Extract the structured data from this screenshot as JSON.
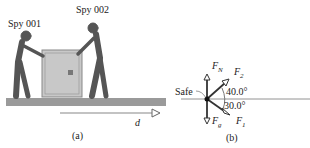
{
  "panel_a": {
    "spy1_label": "Spy 001",
    "spy2_label": "Spy 002",
    "displacement_label": "d",
    "caption": "(a)"
  },
  "panel_b": {
    "safe_label": "Safe",
    "forces": {
      "normal": "F",
      "normal_sub": "N",
      "gravity": "F",
      "gravity_sub": "g",
      "f1": "F",
      "f1_sub": "1",
      "f2": "F",
      "f2_sub": "2"
    },
    "angle_upper": "40.0°",
    "angle_lower": "30.0°",
    "caption": "(b)"
  },
  "colors": {
    "floor": "#9a9a9a",
    "safe": "#c8c8c8",
    "figure": "#555555",
    "arrow": "#333333"
  }
}
